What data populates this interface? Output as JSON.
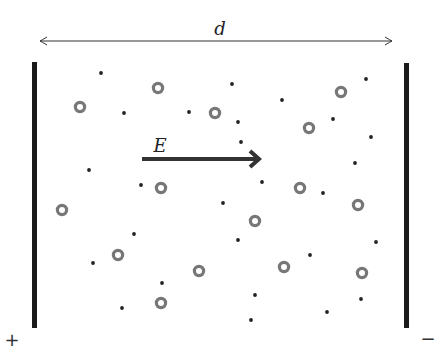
{
  "diagram": {
    "labels": {
      "distance": "d",
      "field": "E",
      "plus": "+",
      "minus": "−"
    },
    "colors": {
      "plate": "#1a1a1a",
      "ion": "#777777",
      "electron": "#222222",
      "arrow": "#333333"
    },
    "plates": [
      {
        "name": "positive-plate",
        "x": 32,
        "y": 62,
        "w": 5,
        "h": 266
      },
      {
        "name": "negative-plate",
        "x": 404,
        "y": 63,
        "w": 5,
        "h": 265
      }
    ],
    "distance_arrow": {
      "x1": 40,
      "x2": 392,
      "y": 41
    },
    "field_arrow": {
      "x1": 142,
      "x2": 259,
      "y": 159
    },
    "ions": [
      [
        158,
        88
      ],
      [
        80,
        107
      ],
      [
        215,
        113
      ],
      [
        341,
        92
      ],
      [
        309,
        128
      ],
      [
        161,
        188
      ],
      [
        62,
        210
      ],
      [
        300,
        188
      ],
      [
        358,
        205
      ],
      [
        255,
        221
      ],
      [
        118,
        255
      ],
      [
        199,
        271
      ],
      [
        284,
        267
      ],
      [
        362,
        273
      ],
      [
        161,
        303
      ]
    ],
    "electrons": [
      [
        101,
        73
      ],
      [
        232,
        84
      ],
      [
        124,
        113
      ],
      [
        189,
        112
      ],
      [
        282,
        100
      ],
      [
        366,
        79
      ],
      [
        333,
        119
      ],
      [
        371,
        137
      ],
      [
        241,
        142
      ],
      [
        89,
        170
      ],
      [
        141,
        185
      ],
      [
        262,
        182
      ],
      [
        355,
        163
      ],
      [
        223,
        203
      ],
      [
        323,
        193
      ],
      [
        134,
        234
      ],
      [
        238,
        240
      ],
      [
        376,
        242
      ],
      [
        310,
        255
      ],
      [
        93,
        263
      ],
      [
        162,
        283
      ],
      [
        255,
        295
      ],
      [
        122,
        308
      ],
      [
        251,
        320
      ],
      [
        327,
        312
      ],
      [
        361,
        299
      ],
      [
        238,
        122
      ]
    ]
  }
}
